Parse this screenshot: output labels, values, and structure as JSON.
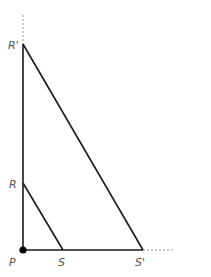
{
  "diagram": {
    "title": "",
    "type": "similar-triangles",
    "colors": {
      "line": "#1a1a1a",
      "dashed": "#999999",
      "label": "#555555",
      "point": "#000000"
    },
    "points": {
      "P": {
        "label": "P",
        "x": 23,
        "y": 250
      },
      "S": {
        "label": "S",
        "x": 63,
        "y": 250
      },
      "S_prime": {
        "label": "S'",
        "x": 143,
        "y": 250
      },
      "R": {
        "label": "R",
        "x": 23,
        "y": 183
      },
      "R_prime": {
        "label": "R'",
        "x": 23,
        "y": 44
      }
    },
    "segments": [
      {
        "from": "P",
        "to": "R_prime",
        "style": "solid"
      },
      {
        "from": "P",
        "to": "S_prime",
        "style": "solid"
      },
      {
        "from": "R",
        "to": "S",
        "style": "solid"
      },
      {
        "from": "R_prime",
        "to": "S_prime",
        "style": "solid"
      },
      {
        "from": "R_prime",
        "to": "top",
        "style": "dashed"
      },
      {
        "from": "S_prime",
        "to": "right",
        "style": "dashed"
      }
    ]
  }
}
